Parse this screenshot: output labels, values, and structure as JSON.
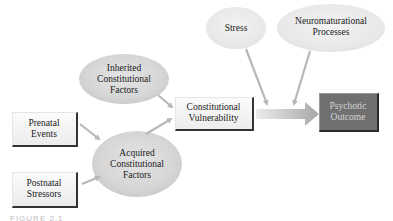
{
  "diagram": {
    "nodes": {
      "inherited": {
        "line1": "Inherited",
        "line2": "Constitutional",
        "line3": "Factors",
        "shape": "ellipse"
      },
      "prenatal": {
        "line1": "Prenatal",
        "line2": "Events",
        "shape": "box"
      },
      "postnatal": {
        "line1": "Postnatal",
        "line2": "Stressors",
        "shape": "box"
      },
      "acquired": {
        "line1": "Acquired",
        "line2": "Constitutional",
        "line3": "Factors",
        "shape": "ellipse"
      },
      "vulnerability": {
        "line1": "Constitutional",
        "line2": "Vulnerability",
        "shape": "box"
      },
      "stress": {
        "line1": "Stress",
        "shape": "ellipse"
      },
      "neuro": {
        "line1": "Neuromaturational",
        "line2": "Processes",
        "shape": "ellipse"
      },
      "outcome": {
        "line1": "Psychotic",
        "line2": "Outcome",
        "shape": "box"
      }
    },
    "edges": [
      {
        "from": "inherited",
        "to": "vulnerability"
      },
      {
        "from": "prenatal",
        "to": "acquired"
      },
      {
        "from": "postnatal",
        "to": "acquired"
      },
      {
        "from": "acquired",
        "to": "vulnerability"
      },
      {
        "from": "stress",
        "to": "vulnerability-outcome-arrow"
      },
      {
        "from": "neuro",
        "to": "vulnerability-outcome-arrow"
      },
      {
        "from": "vulnerability",
        "to": "outcome"
      }
    ],
    "colors": {
      "ellipse_fill": "#dcdcdc",
      "outcome_fill": "#707070",
      "arrow": "#b0b0b0"
    }
  },
  "caption": {
    "text": "FIGURE 2.1"
  }
}
